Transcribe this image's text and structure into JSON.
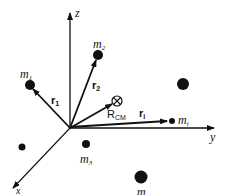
{
  "axes": {
    "x": "x",
    "y": "y",
    "z": "z"
  },
  "masses": [
    {
      "label": "m",
      "sub": "1"
    },
    {
      "label": "m",
      "sub": "2"
    },
    {
      "label": "m",
      "sub": "3"
    },
    {
      "label": "m",
      "sub": "i"
    },
    {
      "label": "m",
      "sub": ""
    }
  ],
  "vectors": [
    {
      "label": "r",
      "sub": "1"
    },
    {
      "label": "r",
      "sub": "2"
    },
    {
      "label": "r",
      "sub": "i"
    },
    {
      "label": "R",
      "sub": "CM"
    }
  ],
  "colors": {
    "ink": "#111111",
    "background": "#ffffff"
  }
}
